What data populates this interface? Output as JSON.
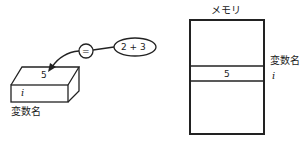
{
  "left_diagram": {
    "box_value": "5",
    "box_variable": "i",
    "box_caption": "変数名",
    "operator": "=",
    "expression": "2 + 3"
  },
  "right_diagram": {
    "title": "メモリ",
    "cell_value": "5",
    "variable_label": "変数名",
    "variable_name": "i"
  }
}
